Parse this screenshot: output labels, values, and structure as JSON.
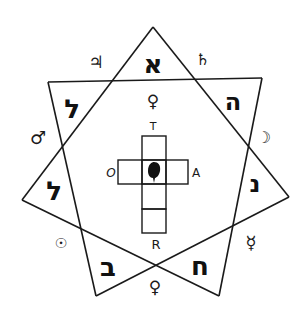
{
  "diagram": {
    "type": "heptagram",
    "stroke_color": "#1a1a1a",
    "background": "#ffffff",
    "vertices": {
      "top": [
        153,
        27
      ],
      "upper_left": [
        48,
        82
      ],
      "upper_right": [
        262,
        78
      ],
      "left": [
        22,
        200
      ],
      "right": [
        289,
        197
      ],
      "bottom_left": [
        96,
        296
      ],
      "bottom_right": [
        219,
        296
      ]
    },
    "hebrew_letters": [
      {
        "position": "top",
        "char": "א",
        "name": "aleph"
      },
      {
        "position": "upper-right",
        "char": "ה",
        "name": "he"
      },
      {
        "position": "right",
        "char": "נ",
        "name": "nun"
      },
      {
        "position": "bottom-right",
        "char": "ח",
        "name": "heth"
      },
      {
        "position": "bottom-left",
        "char": "ב",
        "name": "beth"
      },
      {
        "position": "left",
        "char": "ל",
        "name": "lamed"
      },
      {
        "position": "upper-left",
        "char": "ל",
        "name": "lamed"
      }
    ],
    "planet_symbols": [
      {
        "position": "top-left",
        "char": "♃",
        "name": "jupiter"
      },
      {
        "position": "top-right",
        "char": "♄",
        "name": "saturn"
      },
      {
        "position": "right-upper",
        "char": "☽",
        "name": "moon"
      },
      {
        "position": "right-lower",
        "char": "☿",
        "name": "mercury"
      },
      {
        "position": "bottom",
        "char": "♀",
        "name": "venus"
      },
      {
        "position": "left-lower",
        "char": "☉",
        "name": "sun"
      },
      {
        "position": "left-upper",
        "char": "♂",
        "name": "mars"
      }
    ],
    "center_symbol": {
      "char": "♀",
      "name": "venus"
    },
    "cross": {
      "labels": {
        "top": "T",
        "left": "O",
        "right": "A",
        "bottom": "R"
      }
    }
  }
}
